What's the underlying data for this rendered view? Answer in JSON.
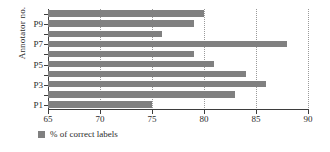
{
  "chart_data": {
    "type": "bar",
    "orientation": "horizontal",
    "title": "",
    "xlabel": "",
    "ylabel": "Annotator no.",
    "categories": [
      "P1",
      "P2",
      "P3",
      "P4",
      "P5",
      "P6",
      "P7",
      "P8",
      "P9",
      "P10"
    ],
    "values": [
      75,
      83,
      86,
      84,
      81,
      79,
      88,
      76,
      79,
      80
    ],
    "series": [
      {
        "name": "% of correct labels",
        "color": "#808080",
        "values": [
          75,
          83,
          86,
          84,
          81,
          79,
          88,
          76,
          79,
          80
        ]
      }
    ],
    "xlim": [
      65,
      90
    ],
    "xticks": [
      65,
      70,
      75,
      80,
      85,
      90
    ],
    "xticklabels": [
      "65",
      "70",
      "75",
      "80",
      "85",
      "90"
    ],
    "yticklabels": [
      "P1",
      "",
      "P3",
      "",
      "P5",
      "",
      "P7",
      "",
      "P9",
      ""
    ],
    "grid": "vertical-dotted",
    "legend": {
      "position": "bottom-left",
      "entries": [
        {
          "label": "% of correct labels",
          "color": "#808080"
        }
      ]
    }
  }
}
